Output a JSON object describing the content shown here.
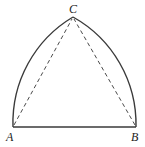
{
  "diagram": {
    "type": "reuleaux-triangle",
    "points": [
      {
        "id": "A",
        "label": "A"
      },
      {
        "id": "B",
        "label": "B"
      },
      {
        "id": "C",
        "label": "C"
      }
    ],
    "edges": [
      {
        "from": "A",
        "to": "B",
        "style": "solid",
        "kind": "segment"
      },
      {
        "from": "A",
        "to": "C",
        "style": "solid",
        "kind": "arc",
        "center": "B"
      },
      {
        "from": "B",
        "to": "C",
        "style": "solid",
        "kind": "arc",
        "center": "A"
      },
      {
        "from": "A",
        "to": "C",
        "style": "dashed",
        "kind": "segment"
      },
      {
        "from": "B",
        "to": "C",
        "style": "dashed",
        "kind": "segment"
      }
    ],
    "colors": {
      "stroke": "#3a3a3a",
      "label": "#222222",
      "background": "#ffffff"
    }
  }
}
